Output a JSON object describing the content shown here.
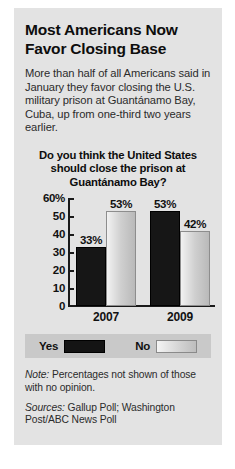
{
  "headline": "Most Americans Now Favor Closing Base",
  "deck": "More than half of all Americans said in January they favor closing the U.S. military prison at Guantánamo Bay, Cuba, up from one-third two years earlier.",
  "footer": {
    "note_label": "Note:",
    "note_text": " Percentages not shown of those with no opinion.",
    "sources_label": "Sources:",
    "sources_text": " Gallup Poll; Washington Post/ABC News Poll"
  },
  "chart_data": {
    "type": "bar",
    "title": "Do you think the United States should close the prison at Guantánamo Bay?",
    "xlabel": "",
    "ylabel": "",
    "categories": [
      "2007",
      "2009"
    ],
    "series": [
      {
        "name": "Yes",
        "values": [
          33,
          53
        ],
        "labels": [
          "33%",
          "53%"
        ],
        "color": "#161616"
      },
      {
        "name": "No",
        "values": [
          53,
          42
        ],
        "labels": [
          "53%",
          "42%"
        ],
        "color": "#cfcfcf"
      }
    ],
    "ylim": [
      0,
      60
    ],
    "yticks": [
      0,
      10,
      20,
      30,
      40,
      50,
      60
    ],
    "ytick_labels": [
      "0",
      "10",
      "20",
      "30",
      "40",
      "50",
      "60%"
    ],
    "grid": false,
    "legend_position": "bottom"
  }
}
